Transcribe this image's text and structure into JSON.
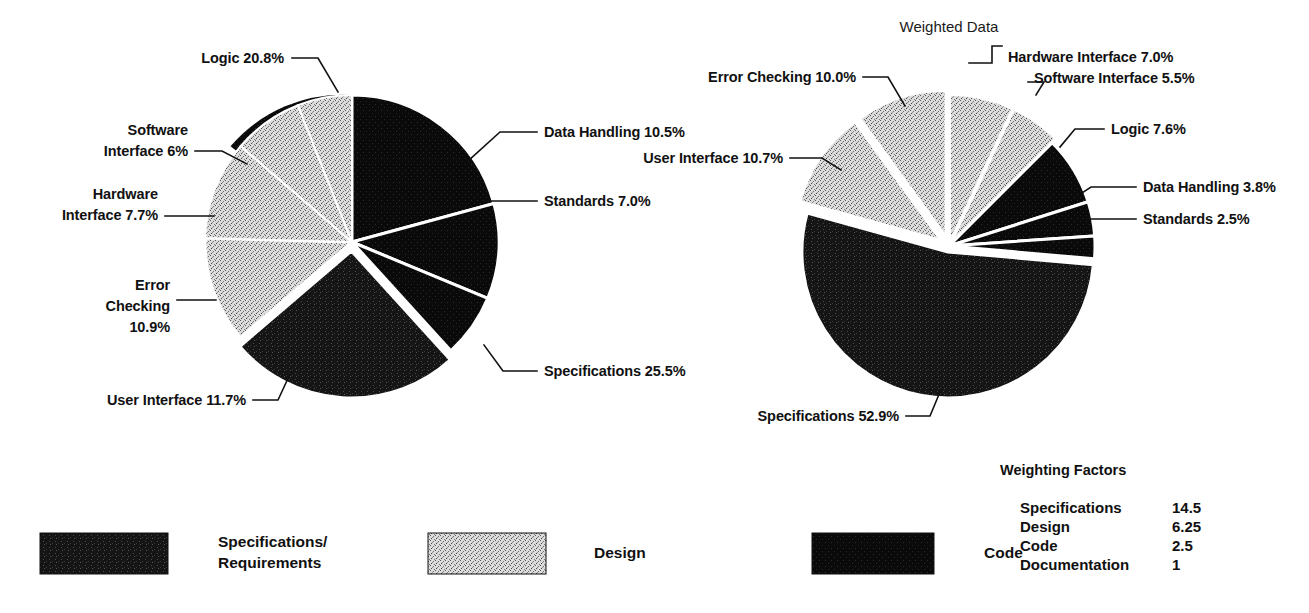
{
  "chart_data": [
    {
      "type": "pie",
      "id": "raw-data-pie",
      "title": "",
      "categories": [
        "Logic",
        "Data Handling",
        "Standards",
        "Specifications",
        "User Interface",
        "Error Checking",
        "Hardware Interface",
        "Software Interface"
      ],
      "values": [
        20.8,
        10.5,
        7.0,
        25.5,
        11.7,
        10.9,
        7.7,
        6.0
      ],
      "labels": [
        "Logic 20.8%",
        "Data Handling 10.5%",
        "Standards 7.0%",
        "Specifications 25.5%",
        "User Interface 11.7%",
        "Error Checking 10.9%",
        "Hardware Interface 7.7%",
        "Software Interface 6%"
      ],
      "groups": [
        "Code",
        "Code",
        "Code",
        "Specifications/Requirements",
        "Design",
        "Design",
        "Design",
        "Design"
      ],
      "unit": "%",
      "legend_position": "bottom"
    },
    {
      "type": "pie",
      "id": "weighted-data-pie",
      "title": "Weighted Data",
      "categories": [
        "Hardware Interface",
        "Software Interface",
        "Logic",
        "Data Handling",
        "Standards",
        "Specifications",
        "User Interface",
        "Error Checking"
      ],
      "values": [
        7.0,
        5.5,
        7.6,
        3.8,
        2.5,
        52.9,
        10.7,
        10.0
      ],
      "labels": [
        "Hardware Interface 7.0%",
        "Software Interface 5.5%",
        "Logic 7.6%",
        "Data Handling 3.8%",
        "Standards 2.5%",
        "Specifications 52.9%",
        "User Interface 10.7%",
        "Error Checking 10.0%"
      ],
      "groups": [
        "Design",
        "Design",
        "Code",
        "Code",
        "Code",
        "Specifications/Requirements",
        "Design",
        "Design"
      ],
      "unit": "%",
      "legend_position": "bottom"
    }
  ],
  "charts": {
    "left": {
      "title": "",
      "labels": {
        "logic": "Logic 20.8%",
        "software_interface": "Software\nInterface 6%",
        "software_interface_l1": "Software",
        "software_interface_l2": "Interface 6%",
        "hardware_interface_l1": "Hardware",
        "hardware_interface_l2": "Interface 7.7%",
        "error_checking_l1": "Error",
        "error_checking_l2": "Checking",
        "error_checking_l3": "10.9%",
        "user_interface": "User Interface 11.7%",
        "data_handling": "Data Handling 10.5%",
        "standards": "Standards 7.0%",
        "specifications": "Specifications 25.5%"
      }
    },
    "right": {
      "title": "Weighted Data",
      "labels": {
        "error_checking": "Error Checking 10.0%",
        "user_interface": "User Interface 10.7%",
        "hardware_interface": "Hardware Interface 7.0%",
        "software_interface": "Software Interface 5.5%",
        "logic": "Logic 7.6%",
        "data_handling": "Data Handling 3.8%",
        "standards": "Standards 2.5%",
        "specifications": "Specifications 52.9%"
      }
    }
  },
  "weighting_factors": {
    "title": "Weighting Factors",
    "rows": [
      {
        "name": "Specifications",
        "value": "14.5"
      },
      {
        "name": "Design",
        "value": "6.25"
      },
      {
        "name": "Code",
        "value": "2.5"
      },
      {
        "name": "Documentation",
        "value": "1"
      }
    ]
  },
  "legend": {
    "items": [
      {
        "label_line1": "Specifications/",
        "label_line2": "Requirements",
        "swatch": "dark-speckle",
        "color": "#151515"
      },
      {
        "label_line1": "Design",
        "label_line2": "",
        "swatch": "light-stipple",
        "color": "#d2d2d2"
      },
      {
        "label_line1": "Code",
        "label_line2": "",
        "swatch": "solid-black",
        "color": "#080808"
      }
    ]
  },
  "colors": {
    "specifications": "#151515",
    "design": "#cfcfcf",
    "code": "#0a0a0a",
    "background": "#ffffff",
    "text": "#111111",
    "leader": "#111111"
  }
}
